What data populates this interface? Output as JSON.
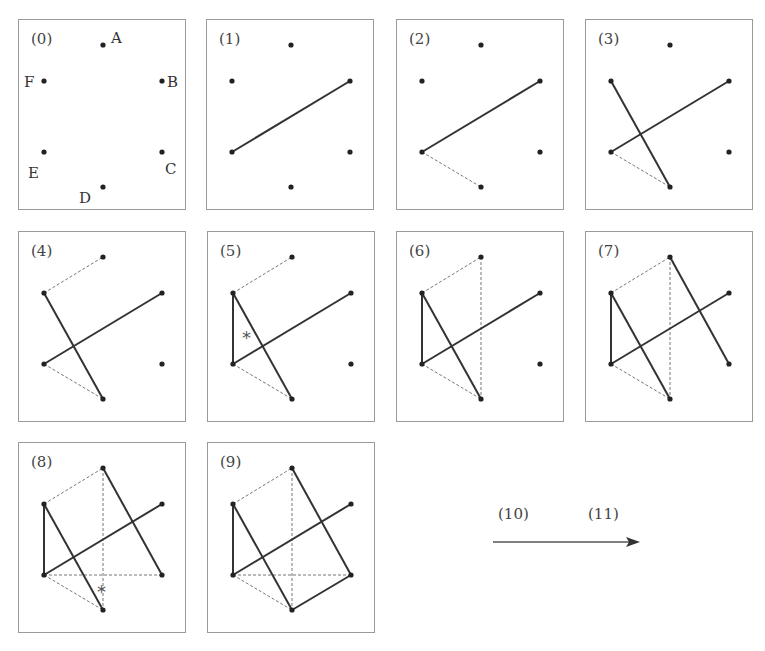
{
  "points": {
    "A": [
      84,
      25
    ],
    "B": [
      143,
      61
    ],
    "C": [
      143,
      132
    ],
    "D": [
      84,
      167
    ],
    "E": [
      25,
      132
    ],
    "F": [
      25,
      61
    ]
  },
  "point_labels": {
    "A": {
      "text": "A",
      "dx": 8,
      "dy": -2
    },
    "B": {
      "text": "B",
      "dx": 5,
      "dy": 6
    },
    "C": {
      "text": "C",
      "dx": 3,
      "dy": 22
    },
    "D": {
      "text": "D",
      "dx": -24,
      "dy": 16
    },
    "E": {
      "text": "E",
      "dx": -16,
      "dy": 26
    },
    "F": {
      "text": "F",
      "dx": -20,
      "dy": 6
    }
  },
  "panels": [
    {
      "label": "(0)",
      "x": 18,
      "y": 19,
      "show_point_labels": true,
      "solid": [],
      "dashed": [],
      "star": null
    },
    {
      "label": "(1)",
      "x": 206,
      "y": 19,
      "show_point_labels": false,
      "solid": [
        [
          "E",
          "B"
        ]
      ],
      "dashed": [],
      "star": null
    },
    {
      "label": "(2)",
      "x": 396,
      "y": 19,
      "show_point_labels": false,
      "solid": [
        [
          "E",
          "B"
        ]
      ],
      "dashed": [
        [
          "E",
          "D"
        ]
      ],
      "star": null
    },
    {
      "label": "(3)",
      "x": 585,
      "y": 19,
      "show_point_labels": false,
      "solid": [
        [
          "E",
          "B"
        ],
        [
          "F",
          "D"
        ]
      ],
      "dashed": [
        [
          "E",
          "D"
        ]
      ],
      "star": null
    },
    {
      "label": "(4)",
      "x": 18,
      "y": 231,
      "show_point_labels": false,
      "solid": [
        [
          "E",
          "B"
        ],
        [
          "F",
          "D"
        ]
      ],
      "dashed": [
        [
          "E",
          "D"
        ],
        [
          "F",
          "A"
        ]
      ],
      "star": null
    },
    {
      "label": "(5)",
      "x": 207,
      "y": 231,
      "show_point_labels": false,
      "solid": [
        [
          "E",
          "B"
        ],
        [
          "F",
          "D"
        ],
        [
          "F",
          "E"
        ]
      ],
      "dashed": [
        [
          "E",
          "D"
        ],
        [
          "F",
          "A"
        ]
      ],
      "star": [
        34,
        112
      ]
    },
    {
      "label": "(6)",
      "x": 396,
      "y": 231,
      "show_point_labels": false,
      "solid": [
        [
          "E",
          "B"
        ],
        [
          "F",
          "D"
        ],
        [
          "F",
          "E"
        ]
      ],
      "dashed": [
        [
          "E",
          "D"
        ],
        [
          "F",
          "A"
        ],
        [
          "A",
          "D"
        ]
      ],
      "star": null
    },
    {
      "label": "(7)",
      "x": 585,
      "y": 231,
      "show_point_labels": false,
      "solid": [
        [
          "E",
          "B"
        ],
        [
          "F",
          "D"
        ],
        [
          "F",
          "E"
        ],
        [
          "A",
          "C"
        ]
      ],
      "dashed": [
        [
          "E",
          "D"
        ],
        [
          "F",
          "A"
        ],
        [
          "A",
          "D"
        ]
      ],
      "star": null
    },
    {
      "label": "(8)",
      "x": 18,
      "y": 442,
      "show_point_labels": false,
      "solid": [
        [
          "E",
          "B"
        ],
        [
          "F",
          "D"
        ],
        [
          "F",
          "E"
        ],
        [
          "A",
          "C"
        ]
      ],
      "dashed": [
        [
          "E",
          "D"
        ],
        [
          "F",
          "A"
        ],
        [
          "A",
          "D"
        ],
        [
          "E",
          "C"
        ]
      ],
      "star": [
        78,
        155
      ]
    },
    {
      "label": "(9)",
      "x": 207,
      "y": 442,
      "show_point_labels": false,
      "solid": [
        [
          "E",
          "B"
        ],
        [
          "F",
          "D"
        ],
        [
          "F",
          "E"
        ],
        [
          "A",
          "C"
        ],
        [
          "D",
          "C"
        ]
      ],
      "dashed": [
        [
          "E",
          "D"
        ],
        [
          "F",
          "A"
        ],
        [
          "A",
          "D"
        ],
        [
          "E",
          "C"
        ]
      ],
      "star": null
    }
  ],
  "sequence": {
    "labels": [
      "(10)",
      "(11)"
    ],
    "arrow": "right-arrow"
  }
}
